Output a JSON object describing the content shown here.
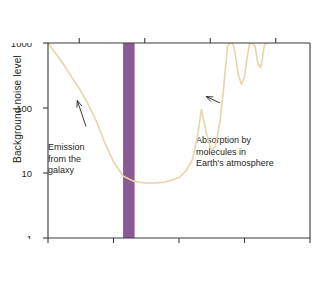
{
  "chart_data": {
    "type": "line",
    "title": "",
    "xlabel": "Frequency (GHz)",
    "ylabel": "Background noise level",
    "secondary_xlabel": "Wavelength (cm)",
    "xscale": "log",
    "yscale": "log",
    "xlim": [
      0.1,
      1000
    ],
    "ylim": [
      1,
      1000
    ],
    "xticks": [
      "0.1",
      "1",
      "10",
      "100",
      "1000"
    ],
    "xtick_values": [
      0.1,
      1,
      10,
      100,
      1000
    ],
    "yticks": [
      "1",
      "10",
      "100",
      "1000"
    ],
    "ytick_values": [
      1,
      10,
      100,
      1000
    ],
    "top_axis_ticks": [
      "100",
      "10",
      "1",
      "0.1"
    ],
    "top_axis_tick_values_cm": [
      100,
      10,
      1,
      0.1
    ],
    "grid": false,
    "legend": "none",
    "curve_color": "#e8d4a8",
    "band_color": "#8b5a96",
    "series": [
      {
        "name": "Background noise level",
        "x": [
          0.1,
          0.13,
          0.17,
          0.22,
          0.3,
          0.4,
          0.55,
          0.75,
          1.0,
          1.4,
          2.0,
          3.0,
          4.5,
          6.0,
          8.0,
          10.0,
          13.0,
          16.0,
          19.0,
          22.0,
          26.0,
          31.0,
          36.0,
          42.0,
          48.0,
          55.0,
          60.0,
          66.0,
          72.0,
          80.0,
          90.0,
          100.0,
          110.0,
          120.0,
          130.0,
          145.0,
          160.0,
          175.0,
          185.0,
          200.0,
          215.0,
          230.0
        ],
        "y": [
          1000.0,
          700.0,
          480.0,
          320.0,
          200.0,
          120.0,
          62.0,
          28.0,
          15.0,
          9.0,
          7.5,
          7.0,
          7.0,
          7.2,
          7.8,
          8.5,
          11.0,
          16.0,
          35.0,
          95.0,
          42.0,
          22.0,
          26.0,
          60.0,
          200.0,
          900.0,
          1000.0,
          1000.0,
          700.0,
          330.0,
          230.0,
          300.0,
          600.0,
          1000.0,
          1000.0,
          900.0,
          480.0,
          420.0,
          520.0,
          900.0,
          1000.0,
          1000.0
        ]
      }
    ],
    "shaded_bands": [
      {
        "name": "radio-window-band",
        "x_start": 1.4,
        "x_end": 2.1,
        "color": "#8b5a96"
      }
    ],
    "annotations": [
      {
        "name": "emission-from-galaxy",
        "text": "Emission\nfrom the\ngalaxy",
        "arrow_from_x": 0.38,
        "arrow_from_y": 52,
        "arrow_to_x": 0.28,
        "arrow_to_y": 130
      },
      {
        "name": "absorption-by-molecules",
        "text": "Absorption by\nmolecules in\nEarth's atmosphere",
        "arrow_from_x": 42.0,
        "arrow_from_y": 120,
        "arrow_to_x": 26.0,
        "arrow_to_y": 150
      }
    ]
  },
  "chart": {
    "wavelength_axis_title": "Wavelength (cm)",
    "frequency_axis_title": "Frequency (GHz)",
    "y_axis_title": "Background noise level",
    "top_ticks": [
      {
        "label": "100"
      },
      {
        "label": "10"
      },
      {
        "label": "1"
      },
      {
        "label": "0.1"
      }
    ],
    "bottom_ticks": [
      {
        "label": "0.1"
      },
      {
        "label": "1"
      },
      {
        "label": "10"
      },
      {
        "label": "100"
      },
      {
        "label": "1000"
      }
    ],
    "y_ticks": [
      {
        "label": "1000"
      },
      {
        "label": "100"
      },
      {
        "label": "10"
      },
      {
        "label": "1"
      }
    ],
    "annotation_emission": "Emission\nfrom the\ngalaxy",
    "annotation_absorption": "Absorption by\nmolecules in\nEarth's atmosphere"
  }
}
